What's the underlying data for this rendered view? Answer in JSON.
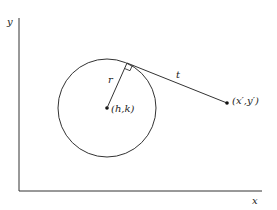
{
  "diagram": {
    "type": "geometry",
    "colors": {
      "stroke": "#333333",
      "background": "#ffffff"
    },
    "axes": {
      "x_label": "x",
      "y_label": "y"
    },
    "circle": {
      "center_label": "(h,k)",
      "radius_label": "r"
    },
    "tangent": {
      "length_label": "t",
      "external_point_label": "(x′,y′)",
      "right_angle_marker": true
    }
  }
}
